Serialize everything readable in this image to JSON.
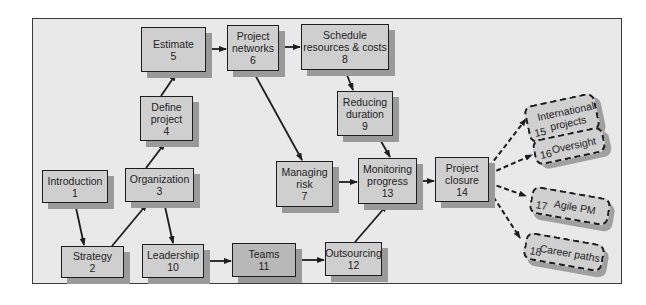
{
  "diagram": {
    "nodes": [
      {
        "id": 1,
        "label": "Introduction",
        "num": "1"
      },
      {
        "id": 2,
        "label": "Strategy",
        "num": "2"
      },
      {
        "id": 3,
        "label": "Organization",
        "num": "3"
      },
      {
        "id": 4,
        "label": "Define project",
        "num": "4"
      },
      {
        "id": 5,
        "label": "Estimate",
        "num": "5"
      },
      {
        "id": 6,
        "label": "Project networks",
        "num": "6"
      },
      {
        "id": 7,
        "label": "Managing risk",
        "num": "7"
      },
      {
        "id": 8,
        "label": "Schedule resources & costs",
        "num": "8"
      },
      {
        "id": 9,
        "label": "Reducing duration",
        "num": "9"
      },
      {
        "id": 10,
        "label": "Leadership",
        "num": "10"
      },
      {
        "id": 11,
        "label": "Teams",
        "num": "11"
      },
      {
        "id": 12,
        "label": "Outsourcing",
        "num": "12"
      },
      {
        "id": 13,
        "label": "Monitoring progress",
        "num": "13"
      },
      {
        "id": 14,
        "label": "Project closure",
        "num": "14"
      }
    ],
    "optional_nodes": [
      {
        "id": 15,
        "label": "International projects",
        "num": "15"
      },
      {
        "id": 16,
        "label": "Oversight",
        "num": "16"
      },
      {
        "id": 17,
        "label": "Agile PM",
        "num": "17"
      },
      {
        "id": 18,
        "label": "Career paths",
        "num": "18"
      }
    ],
    "edges": [
      {
        "from": 1,
        "to": 2,
        "style": "solid"
      },
      {
        "from": 2,
        "to": 3,
        "style": "solid"
      },
      {
        "from": 3,
        "to": 4,
        "style": "solid"
      },
      {
        "from": 3,
        "to": 10,
        "style": "solid"
      },
      {
        "from": 4,
        "to": 5,
        "style": "solid"
      },
      {
        "from": 5,
        "to": 6,
        "style": "solid"
      },
      {
        "from": 6,
        "to": 8,
        "style": "solid"
      },
      {
        "from": 6,
        "to": 7,
        "style": "solid"
      },
      {
        "from": 8,
        "to": 9,
        "style": "solid"
      },
      {
        "from": 9,
        "to": 13,
        "style": "solid"
      },
      {
        "from": 7,
        "to": 13,
        "style": "solid"
      },
      {
        "from": 10,
        "to": 11,
        "style": "solid"
      },
      {
        "from": 11,
        "to": 12,
        "style": "solid"
      },
      {
        "from": 12,
        "to": 13,
        "style": "solid"
      },
      {
        "from": 13,
        "to": 14,
        "style": "solid"
      },
      {
        "from": 14,
        "to": 15,
        "style": "dashed"
      },
      {
        "from": 14,
        "to": 16,
        "style": "dashed"
      },
      {
        "from": 14,
        "to": 17,
        "style": "dashed"
      },
      {
        "from": 14,
        "to": 18,
        "style": "dashed"
      }
    ],
    "colors": {
      "panel_bg": "#e9e9e9",
      "box_fill": "#cfcfcf",
      "box_fill_dark": "#b8b8b8",
      "shadow": "#9a9a9a",
      "line": "#1e1e1e"
    }
  }
}
